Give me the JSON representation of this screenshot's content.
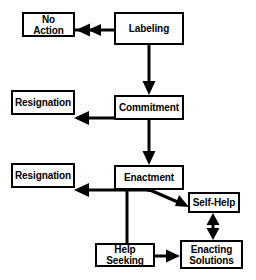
{
  "diagram": {
    "type": "flowchart",
    "line_color": "#000000",
    "box_fill": "#ffffff",
    "background": "#ffffff",
    "caption_fragment": "",
    "nodes": [
      {
        "id": "no_action",
        "label": "No Action",
        "x": 22,
        "y": 12,
        "w": 53,
        "h": 25
      },
      {
        "id": "labeling",
        "label": "Labeling",
        "x": 114,
        "y": 12,
        "w": 70,
        "h": 33
      },
      {
        "id": "resignation_1",
        "label": "Resignation",
        "x": 11,
        "y": 90,
        "w": 64,
        "h": 25
      },
      {
        "id": "commitment",
        "label": "Commitment",
        "x": 114,
        "y": 95,
        "w": 70,
        "h": 25
      },
      {
        "id": "resignation_2",
        "label": "Resignation",
        "x": 11,
        "y": 163,
        "w": 64,
        "h": 25
      },
      {
        "id": "enactment",
        "label": "Enactment",
        "x": 114,
        "y": 165,
        "w": 70,
        "h": 25
      },
      {
        "id": "self_help",
        "label": "Self-Help",
        "x": 188,
        "y": 192,
        "w": 52,
        "h": 21
      },
      {
        "id": "help_seeking",
        "label": "Help Seeking",
        "x": 95,
        "y": 243,
        "w": 60,
        "h": 24
      },
      {
        "id": "enacting_solutions",
        "label": "Enacting\nSolutions",
        "x": 180,
        "y": 240,
        "w": 63,
        "h": 29
      }
    ],
    "edges": [
      {
        "id": "labeling-to-no-action",
        "from": "labeling",
        "to": "no_action",
        "direction": "one-way"
      },
      {
        "id": "labeling-to-commitment",
        "from": "labeling",
        "to": "commitment",
        "direction": "one-way"
      },
      {
        "id": "commitment-to-resignation",
        "from": "commitment",
        "to": "resignation_1",
        "direction": "one-way"
      },
      {
        "id": "commitment-to-enactment",
        "from": "commitment",
        "to": "enactment",
        "direction": "one-way"
      },
      {
        "id": "enactment-to-resignation",
        "from": "enactment",
        "to": "resignation_2",
        "direction": "one-way"
      },
      {
        "id": "enactment-to-self-help",
        "from": "enactment",
        "to": "self_help",
        "direction": "one-way"
      },
      {
        "id": "enactment-to-help-seeking",
        "from": "enactment",
        "to": "help_seeking",
        "direction": "plain-line"
      },
      {
        "id": "help-seeking-to-enacting",
        "from": "help_seeking",
        "to": "enacting_solutions",
        "direction": "one-way"
      },
      {
        "id": "self-help-enacting-solutions",
        "from": "self_help",
        "to": "enacting_solutions",
        "direction": "two-way"
      }
    ]
  }
}
